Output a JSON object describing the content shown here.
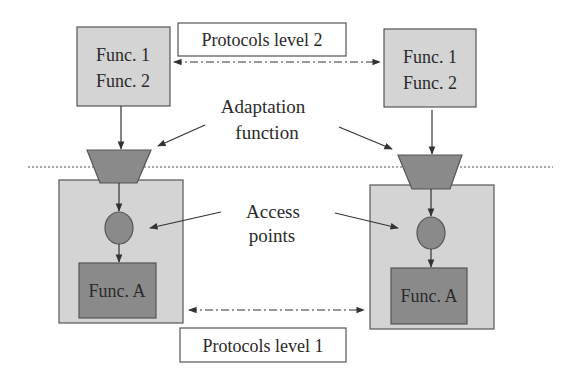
{
  "diagram": {
    "top_left_box": {
      "line1": "Func. 1",
      "line2": "Func. 2"
    },
    "top_right_box": {
      "line1": "Func. 1",
      "line2": "Func. 2"
    },
    "protocols_level_2": "Protocols level 2",
    "protocols_level_1": "Protocols level 1",
    "adaptation_label": {
      "line1": "Adaptation",
      "line2": "function"
    },
    "access_label": {
      "line1": "Access",
      "line2": "points"
    },
    "bottom_left_func": "Func. A",
    "bottom_right_func": "Func. A",
    "colors": {
      "light_box": "#d4d4d4",
      "dark_shape": "#8a8a8a",
      "outline": "#555555",
      "text": "#2a2a2a"
    }
  }
}
